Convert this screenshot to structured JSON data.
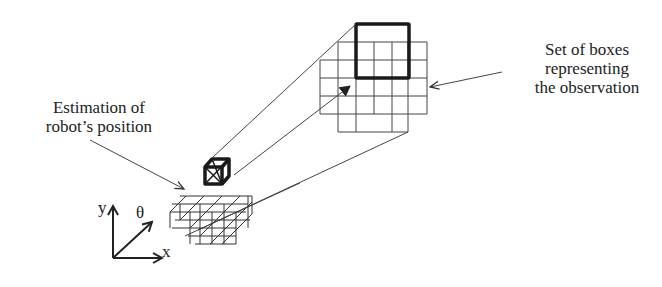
{
  "labels": {
    "estimation_line1": "Estimation of",
    "estimation_line2": "robot’s position",
    "observation_line1": "Set of boxes",
    "observation_line2": "representing",
    "observation_line3": "the observation"
  },
  "axes": {
    "x": "x",
    "y": "y",
    "theta": "θ"
  },
  "colors": {
    "line": "#333333",
    "bold": "#1a1a1a",
    "background": "#ffffff"
  }
}
